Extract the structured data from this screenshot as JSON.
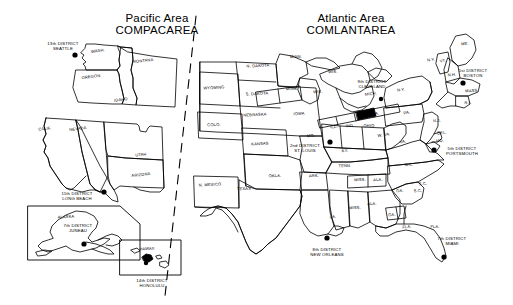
{
  "figure": {
    "type": "map"
  },
  "panels": [
    {
      "id": "pacific",
      "title_line1": "Pacific Area",
      "title_line2": "COMPACAREA"
    },
    {
      "id": "atlantic",
      "title_line1": "Atlantic Area",
      "title_line2": "COMLANTAREA"
    }
  ],
  "divider": {
    "name": "area-divider",
    "style": "dashed"
  },
  "districts": [
    {
      "id": "d13",
      "line1": "13th DISTRICT",
      "line2": "SEATTLE",
      "area": "pacific",
      "x": 63,
      "y": 46,
      "dot_x": 75,
      "dot_y": 55
    },
    {
      "id": "d11",
      "line1": "11th DISTRICT",
      "line2": "LONG BEACH",
      "area": "pacific",
      "x": 77,
      "y": 196,
      "dot_x": 104,
      "dot_y": 192
    },
    {
      "id": "d7a",
      "line1": "7th DISTRICT",
      "line2": "JUNEAU",
      "area": "pacific",
      "x": 78,
      "y": 228,
      "dot_x": 84,
      "dot_y": 244
    },
    {
      "id": "d14",
      "line1": "14th DISTRICT",
      "line2": "HONOLULU",
      "area": "pacific",
      "x": 152,
      "y": 283,
      "dot_x": 146,
      "dot_y": 263
    },
    {
      "id": "d9",
      "line1": "9th DISTRICT",
      "line2": "CLEVELAND",
      "area": "atlantic",
      "x": 372,
      "y": 84,
      "dot_x": 381,
      "dot_y": 99
    },
    {
      "id": "d1",
      "line1": "1st DISTRICT",
      "line2": "BOSTON",
      "area": "atlantic",
      "x": 473,
      "y": 73,
      "dot_x": 463,
      "dot_y": 83
    },
    {
      "id": "d5",
      "line1": "5th DISTRICT",
      "line2": "PORTSMOUTH",
      "area": "atlantic",
      "x": 462,
      "y": 151,
      "dot_x": 434,
      "dot_y": 150
    },
    {
      "id": "d2",
      "line1": "2nd DISTRICT",
      "line2": "ST. LOUIS",
      "area": "atlantic",
      "x": 305,
      "y": 148,
      "dot_x": 330,
      "dot_y": 142
    },
    {
      "id": "d8",
      "line1": "8th DISTRICT",
      "line2": "NEW ORLEANS",
      "area": "atlantic",
      "x": 327,
      "y": 252,
      "dot_x": 327,
      "dot_y": 238
    },
    {
      "id": "d7b",
      "line1": "7th DISTRICT",
      "line2": "MIAMI",
      "area": "atlantic",
      "x": 452,
      "y": 241,
      "dot_x": 444,
      "dot_y": 257
    }
  ],
  "state_labels": [
    {
      "t": "WASH.",
      "x": 98,
      "y": 52,
      "r": -8
    },
    {
      "t": "MONTANA",
      "x": 143,
      "y": 62,
      "r": -6
    },
    {
      "t": "OREGON",
      "x": 91,
      "y": 78,
      "r": -7
    },
    {
      "t": "IDAHO",
      "x": 121,
      "y": 101,
      "r": -8
    },
    {
      "t": "CALIF.",
      "x": 45,
      "y": 130,
      "r": -6
    },
    {
      "t": "NEVADA",
      "x": 78,
      "y": 130,
      "r": -7
    },
    {
      "t": "UTAH",
      "x": 141,
      "y": 156,
      "r": -6
    },
    {
      "t": "ARIZONA",
      "x": 141,
      "y": 176,
      "r": -6
    },
    {
      "t": "ALASKA",
      "x": 66,
      "y": 218,
      "r": -3
    },
    {
      "t": "HAWAII",
      "x": 147,
      "y": 250,
      "r": -3
    },
    {
      "t": "N. DAKOTA",
      "x": 258,
      "y": 67,
      "r": -3
    },
    {
      "t": "S. DAKOTA",
      "x": 257,
      "y": 95,
      "r": -3
    },
    {
      "t": "MINN.",
      "x": 292,
      "y": 90,
      "r": -3
    },
    {
      "t": "MINN.",
      "x": 296,
      "y": 58,
      "r": -3
    },
    {
      "t": "WIS.",
      "x": 318,
      "y": 93,
      "r": -3
    },
    {
      "t": "WIS.",
      "x": 333,
      "y": 73,
      "r": -3
    },
    {
      "t": "WYOMING",
      "x": 214,
      "y": 89,
      "r": -3
    },
    {
      "t": "NEBRASKA",
      "x": 255,
      "y": 116,
      "r": -3
    },
    {
      "t": "IOWA",
      "x": 299,
      "y": 115,
      "r": -3
    },
    {
      "t": "COLO.",
      "x": 214,
      "y": 126,
      "r": -3
    },
    {
      "t": "KANSAS",
      "x": 260,
      "y": 145,
      "r": -3
    },
    {
      "t": "MO.",
      "x": 311,
      "y": 137,
      "r": -3
    },
    {
      "t": "ILL.",
      "x": 334,
      "y": 128,
      "r": -3
    },
    {
      "t": "IND.",
      "x": 350,
      "y": 127,
      "r": -3
    },
    {
      "t": "OHIO",
      "x": 369,
      "y": 127,
      "r": -3
    },
    {
      "t": "MICH.",
      "x": 371,
      "y": 95,
      "r": -6
    },
    {
      "t": "N.Y.",
      "x": 401,
      "y": 91,
      "r": -8
    },
    {
      "t": "KY.",
      "x": 345,
      "y": 152,
      "r": -3
    },
    {
      "t": "TENN.",
      "x": 345,
      "y": 167,
      "r": -3
    },
    {
      "t": "W. VA.",
      "x": 384,
      "y": 136,
      "r": -8
    },
    {
      "t": "VA.",
      "x": 403,
      "y": 143,
      "r": -8
    },
    {
      "t": "PA.",
      "x": 376,
      "y": 115,
      "r": -8
    },
    {
      "t": "PA.",
      "x": 407,
      "y": 114,
      "r": -8
    },
    {
      "t": "N.J.",
      "x": 437,
      "y": 122,
      "r": -5
    },
    {
      "t": "DEL.",
      "x": 442,
      "y": 134,
      "r": -5
    },
    {
      "t": "MD.",
      "x": 440,
      "y": 142,
      "r": -5
    },
    {
      "t": "N.C.",
      "x": 409,
      "y": 166,
      "r": -3
    },
    {
      "t": "S.C.",
      "x": 423,
      "y": 185,
      "r": -3
    },
    {
      "t": "S.C.",
      "x": 418,
      "y": 192,
      "r": -3
    },
    {
      "t": "GA.",
      "x": 400,
      "y": 192,
      "r": -3
    },
    {
      "t": "GA.",
      "x": 392,
      "y": 216,
      "r": -3
    },
    {
      "t": "FLA.",
      "x": 435,
      "y": 228,
      "r": -3
    },
    {
      "t": "FLA.",
      "x": 407,
      "y": 228,
      "r": -5
    },
    {
      "t": "ALA.",
      "x": 372,
      "y": 205,
      "r": -3
    },
    {
      "t": "ALA.",
      "x": 378,
      "y": 181,
      "r": -3
    },
    {
      "t": "MISS.",
      "x": 355,
      "y": 209,
      "r": -3
    },
    {
      "t": "MISS.",
      "x": 360,
      "y": 181,
      "r": -3
    },
    {
      "t": "LA.",
      "x": 333,
      "y": 218,
      "r": -3
    },
    {
      "t": "ARK.",
      "x": 314,
      "y": 177,
      "r": -3
    },
    {
      "t": "OKLA.",
      "x": 275,
      "y": 177,
      "r": -3
    },
    {
      "t": "TEXAS",
      "x": 244,
      "y": 190,
      "r": -3
    },
    {
      "t": "N. MEXICO",
      "x": 210,
      "y": 186,
      "r": -3
    },
    {
      "t": "ME.",
      "x": 465,
      "y": 45,
      "r": -3
    },
    {
      "t": "N.H.",
      "x": 452,
      "y": 76,
      "r": -3
    },
    {
      "t": "VT.",
      "x": 443,
      "y": 62,
      "r": -8
    },
    {
      "t": "N.Y.",
      "x": 431,
      "y": 61,
      "r": -8
    },
    {
      "t": "MASS.",
      "x": 472,
      "y": 92,
      "r": -3
    },
    {
      "t": "R.I.",
      "x": 468,
      "y": 104,
      "r": -3
    }
  ]
}
